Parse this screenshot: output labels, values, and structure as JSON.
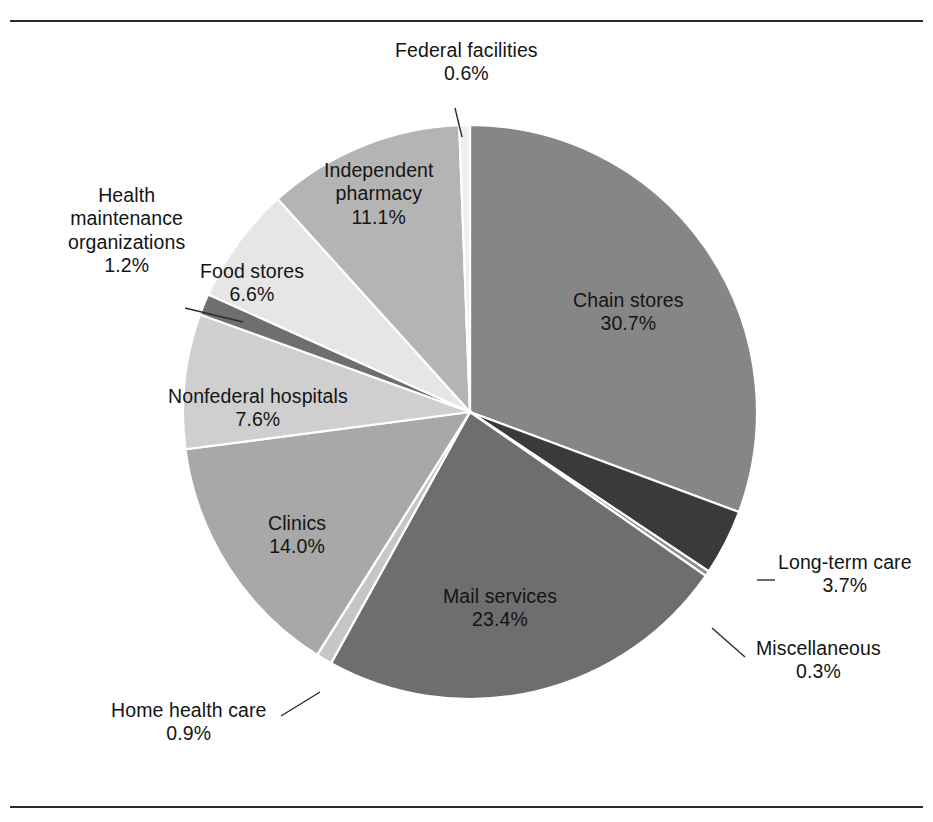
{
  "figure": {
    "background_color": "#ffffff",
    "rule_color": "#2b2b2b",
    "has_top_rule": true,
    "has_bottom_rule": true
  },
  "chart_data": {
    "type": "pie",
    "title": "",
    "subtitle": "",
    "xlabel": "",
    "ylabel": "",
    "legend_position": "none",
    "grid": false,
    "labels_show_percent": true,
    "start_angle_deg": -90,
    "direction": "clockwise",
    "categories": [
      "Chain stores",
      "Long-term care",
      "Miscellaneous",
      "Mail services",
      "Home health care",
      "Clinics",
      "Nonfederal hospitals",
      "Health maintenance organizations",
      "Food stores",
      "Independent pharmacy",
      "Federal facilities"
    ],
    "values": [
      30.7,
      3.7,
      0.3,
      23.4,
      0.9,
      14.0,
      7.6,
      1.2,
      6.6,
      11.1,
      0.6
    ],
    "value_labels": [
      "30.7%",
      "3.7%",
      "0.3%",
      "23.4%",
      "0.9%",
      "14.0%",
      "7.6%",
      "1.2%",
      "6.6%",
      "11.1%",
      "0.6%"
    ],
    "colors": [
      "#868686",
      "#3a3a3a",
      "#8f8f8f",
      "#6e6e6e",
      "#c6c6c6",
      "#a8a8a8",
      "#cfcfcf",
      "#6f6f6f",
      "#e6e6e6",
      "#b4b4b4",
      "#efefef"
    ],
    "slice_edge_color": "#ffffff",
    "units": "percent",
    "total": 100.0
  },
  "slices": [
    {
      "id": "chain-stores",
      "name": "Chain stores",
      "pct": "30.7%",
      "value": 30.7,
      "color": "#868686",
      "label_placement": "inside",
      "label_x": 628,
      "label_y": 312,
      "label_tone": "dark"
    },
    {
      "id": "long-term-care",
      "name": "Long-term care",
      "pct": "3.7%",
      "value": 3.7,
      "color": "#3a3a3a",
      "label_placement": "outside",
      "label_x": 845,
      "label_y": 574,
      "label_tone": "dark",
      "leader": {
        "x1": 757,
        "y1": 580,
        "x2": 775,
        "y2": 580
      }
    },
    {
      "id": "miscellaneous",
      "name": "Miscellaneous",
      "pct": "0.3%",
      "value": 0.3,
      "color": "#8f8f8f",
      "label_placement": "outside",
      "label_x": 818,
      "label_y": 660,
      "label_tone": "dark",
      "leader": {
        "x1": 712,
        "y1": 628,
        "x2": 745,
        "y2": 657
      }
    },
    {
      "id": "mail-services",
      "name": "Mail services",
      "pct": "23.4%",
      "value": 23.4,
      "color": "#6e6e6e",
      "label_placement": "inside",
      "label_x": 500,
      "label_y": 608,
      "label_tone": "dark"
    },
    {
      "id": "home-health-care",
      "name": "Home health care",
      "pct": "0.9%",
      "value": 0.9,
      "color": "#c6c6c6",
      "label_placement": "outside",
      "label_x": 189,
      "label_y": 722,
      "label_tone": "dark",
      "leader": {
        "x1": 281,
        "y1": 716,
        "x2": 320,
        "y2": 692
      }
    },
    {
      "id": "clinics",
      "name": "Clinics",
      "pct": "14.0%",
      "value": 14.0,
      "color": "#a8a8a8",
      "label_placement": "inside",
      "label_x": 297,
      "label_y": 535,
      "label_tone": "dark"
    },
    {
      "id": "nonfederal-hospitals",
      "name": "Nonfederal hospitals",
      "pct": "7.6%",
      "value": 7.6,
      "color": "#cfcfcf",
      "label_placement": "inside",
      "label_x": 258,
      "label_y": 408,
      "label_tone": "dark"
    },
    {
      "id": "health-maintenance-organizations",
      "name": "Health\nmaintenance\norganizations",
      "pct": "1.2%",
      "value": 1.2,
      "color": "#6f6f6f",
      "label_placement": "outside",
      "label_x": 126,
      "label_y": 231,
      "label_tone": "dark",
      "leader": {
        "x1": 185,
        "y1": 308,
        "x2": 243,
        "y2": 322
      }
    },
    {
      "id": "food-stores",
      "name": "Food stores",
      "pct": "6.6%",
      "value": 6.6,
      "color": "#e6e6e6",
      "label_placement": "inside",
      "label_x": 252,
      "label_y": 283,
      "label_tone": "dark"
    },
    {
      "id": "independent-pharmacy",
      "name": "Independent\npharmacy",
      "pct": "11.1%",
      "value": 11.1,
      "color": "#b4b4b4",
      "label_placement": "inside",
      "label_x": 379,
      "label_y": 194,
      "label_tone": "dark"
    },
    {
      "id": "federal-facilities",
      "name": "Federal facilities",
      "pct": "0.6%",
      "value": 0.6,
      "color": "#efefef",
      "label_placement": "outside",
      "label_x": 466,
      "label_y": 62,
      "label_tone": "dark",
      "leader": {
        "x1": 455,
        "y1": 108,
        "x2": 462,
        "y2": 137
      }
    }
  ],
  "geometry": {
    "center_x": 470,
    "center_y": 412,
    "radius": 287
  }
}
